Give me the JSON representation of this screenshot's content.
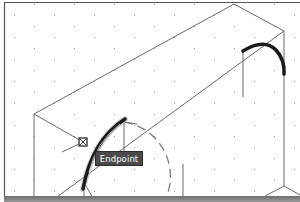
{
  "app": {
    "view": "cad-drawing-viewport"
  },
  "snap_tooltip": {
    "label": "Endpoint"
  },
  "colors": {
    "background": "#ffffff",
    "grid_dot": "#9a9a9a",
    "geometry_line": "#6a6a6a",
    "highlight_arc": "#1a1a1a",
    "frame": "#555555",
    "tooltip_bg": "#4a4a4a",
    "tooltip_text": "#ffffff",
    "dashed_preview": "#7a7a7a"
  },
  "grid": {
    "spacing_x": 20,
    "spacing_y": 11,
    "style": "dots"
  },
  "snap_marker": {
    "type": "endpoint",
    "x": 83,
    "y": 142
  }
}
